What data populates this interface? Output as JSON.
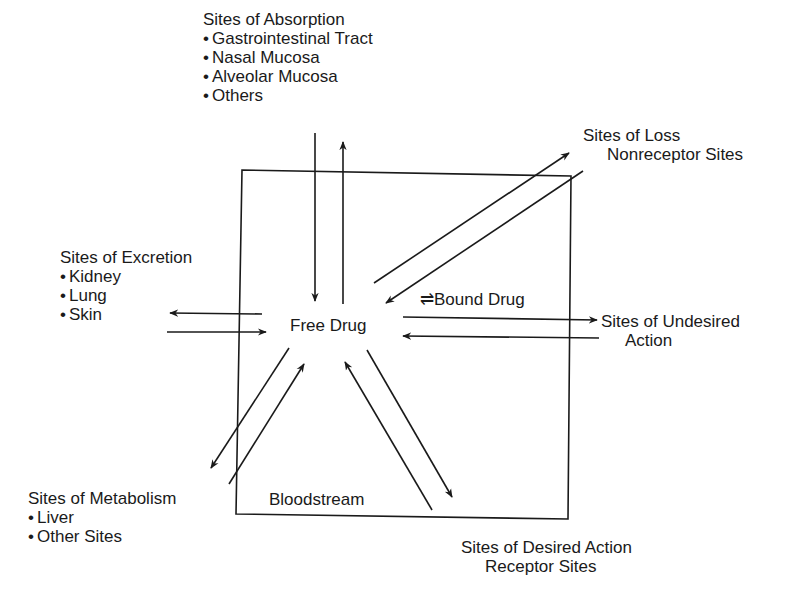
{
  "diagram": {
    "compartment": {
      "label": "Bloodstream",
      "center": "Free Drug",
      "bound": "Bound Drug",
      "equilibrium_symbol": "⇌"
    },
    "absorption": {
      "title": "Sites of Absorption",
      "items": [
        "Gastrointestinal Tract",
        "Nasal Mucosa",
        "Alveolar Mucosa",
        "Others"
      ]
    },
    "loss": {
      "title": "Sites of Loss",
      "subtitle": "Nonreceptor Sites"
    },
    "excretion": {
      "title": "Sites of Excretion",
      "items": [
        "Kidney",
        "Lung",
        "Skin"
      ]
    },
    "undesired": {
      "title": "Sites of Undesired",
      "subtitle": "Action"
    },
    "metabolism": {
      "title": "Sites of Metabolism",
      "items": [
        "Liver",
        "Other Sites"
      ]
    },
    "desired": {
      "title": "Sites of Desired Action",
      "subtitle": "Receptor Sites"
    }
  }
}
